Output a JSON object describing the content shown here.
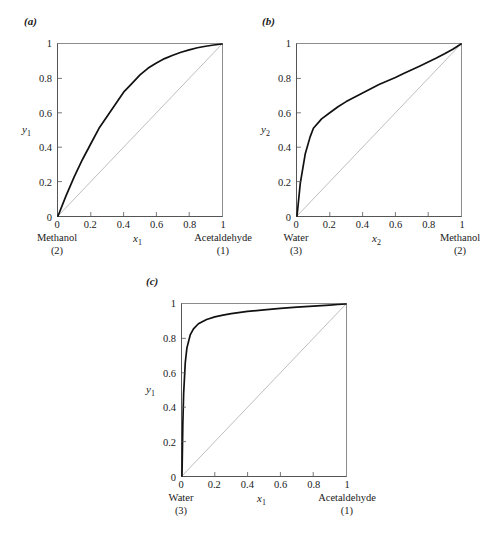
{
  "figure": {
    "background_color": "#ffffff",
    "curve_color": "#111111",
    "diagonal_color": "#6e6e6e",
    "axis_color": "#555555"
  },
  "panels": [
    {
      "id": "a",
      "letter": "(a)",
      "xlabel": "x",
      "xlabel_sub": "1",
      "ylabel": "y",
      "ylabel_sub": "1",
      "left_component": "Methanol",
      "left_component_number": "(2)",
      "right_component": "Acetaldehyde",
      "right_component_number": "(1)",
      "xticks": [
        "0",
        "0.2",
        "0.4",
        "0.6",
        "0.8",
        "1"
      ],
      "yticks": [
        "0",
        "0.2",
        "0.4",
        "0.6",
        "0.8",
        "1"
      ]
    },
    {
      "id": "b",
      "letter": "(b)",
      "xlabel": "x",
      "xlabel_sub": "2",
      "ylabel": "y",
      "ylabel_sub": "2",
      "left_component": "Water",
      "left_component_number": "(3)",
      "right_component": "Methanol",
      "right_component_number": "(2)",
      "xticks": [
        "0",
        "0.2",
        "0.4",
        "0.6",
        "0.8",
        "1"
      ],
      "yticks": [
        "0",
        "0.2",
        "0.4",
        "0.6",
        "0.8",
        "1"
      ]
    },
    {
      "id": "c",
      "letter": "(c)",
      "xlabel": "x",
      "xlabel_sub": "1",
      "ylabel": "y",
      "ylabel_sub": "1",
      "left_component": "Water",
      "left_component_number": "(3)",
      "right_component": "Acetaldehyde",
      "right_component_number": "(1)",
      "xticks": [
        "0",
        "0.2",
        "0.4",
        "0.6",
        "0.8",
        "1"
      ],
      "yticks": [
        "0",
        "0.2",
        "0.4",
        "0.6",
        "0.8",
        "1"
      ]
    }
  ],
  "chart_data": [
    {
      "type": "line",
      "panel": "a",
      "title": "(a) Methanol (2) - Acetaldehyde (1) x-y diagram",
      "xlabel": "x1",
      "ylabel": "y1",
      "xlim": [
        0,
        1
      ],
      "ylim": [
        0,
        1
      ],
      "xticks": [
        0,
        0.2,
        0.4,
        0.6,
        0.8,
        1
      ],
      "yticks": [
        0,
        0.2,
        0.4,
        0.6,
        0.8,
        1
      ],
      "grid": false,
      "legend": "none",
      "series": [
        {
          "name": "equilibrium curve",
          "x": [
            0,
            0.05,
            0.1,
            0.15,
            0.2,
            0.25,
            0.3,
            0.35,
            0.4,
            0.45,
            0.5,
            0.55,
            0.6,
            0.65,
            0.7,
            0.75,
            0.8,
            0.85,
            0.9,
            0.95,
            1
          ],
          "y": [
            0,
            0.12,
            0.23,
            0.33,
            0.42,
            0.51,
            0.58,
            0.65,
            0.72,
            0.77,
            0.82,
            0.86,
            0.89,
            0.915,
            0.935,
            0.952,
            0.966,
            0.978,
            0.987,
            0.994,
            1
          ]
        },
        {
          "name": "45 degree diagonal",
          "x": [
            0,
            1
          ],
          "y": [
            0,
            1
          ]
        }
      ]
    },
    {
      "type": "line",
      "panel": "b",
      "title": "(b) Water (3) - Methanol (2) x-y diagram",
      "xlabel": "x2",
      "ylabel": "y2",
      "xlim": [
        0,
        1
      ],
      "ylim": [
        0,
        1
      ],
      "xticks": [
        0,
        0.2,
        0.4,
        0.6,
        0.8,
        1
      ],
      "yticks": [
        0,
        0.2,
        0.4,
        0.6,
        0.8,
        1
      ],
      "grid": false,
      "legend": "none",
      "series": [
        {
          "name": "equilibrium curve",
          "x": [
            0,
            0.02,
            0.05,
            0.08,
            0.1,
            0.15,
            0.2,
            0.25,
            0.3,
            0.35,
            0.4,
            0.45,
            0.5,
            0.55,
            0.6,
            0.65,
            0.7,
            0.75,
            0.8,
            0.85,
            0.9,
            0.95,
            1
          ],
          "y": [
            0,
            0.19,
            0.36,
            0.46,
            0.51,
            0.565,
            0.6,
            0.635,
            0.665,
            0.69,
            0.715,
            0.74,
            0.765,
            0.785,
            0.805,
            0.828,
            0.85,
            0.872,
            0.895,
            0.918,
            0.943,
            0.97,
            1
          ]
        },
        {
          "name": "45 degree diagonal",
          "x": [
            0,
            1
          ],
          "y": [
            0,
            1
          ]
        }
      ]
    },
    {
      "type": "line",
      "panel": "c",
      "title": "(c) Water (3) - Acetaldehyde (1) x-y diagram",
      "xlabel": "x1",
      "ylabel": "y1",
      "xlim": [
        0,
        1
      ],
      "ylim": [
        0,
        1
      ],
      "xticks": [
        0,
        0.2,
        0.4,
        0.6,
        0.8,
        1
      ],
      "yticks": [
        0,
        0.2,
        0.4,
        0.6,
        0.8,
        1
      ],
      "grid": false,
      "legend": "none",
      "series": [
        {
          "name": "equilibrium curve",
          "x": [
            0,
            0.005,
            0.01,
            0.02,
            0.03,
            0.05,
            0.07,
            0.1,
            0.15,
            0.2,
            0.25,
            0.3,
            0.4,
            0.5,
            0.6,
            0.7,
            0.8,
            0.9,
            0.95,
            1
          ],
          "y": [
            0,
            0.3,
            0.48,
            0.66,
            0.745,
            0.82,
            0.855,
            0.885,
            0.91,
            0.925,
            0.935,
            0.944,
            0.957,
            0.966,
            0.975,
            0.982,
            0.988,
            0.994,
            0.997,
            1
          ]
        },
        {
          "name": "45 degree diagonal",
          "x": [
            0,
            1
          ],
          "y": [
            0,
            1
          ]
        }
      ]
    }
  ]
}
